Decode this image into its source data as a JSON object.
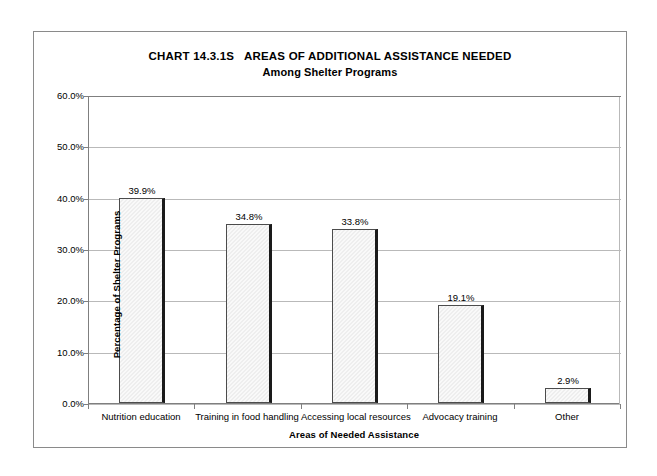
{
  "chart_data": {
    "type": "bar",
    "title": "CHART 14.3.1S   AREAS OF ADDITIONAL ASSISTANCE NEEDED",
    "subtitle": "Among Shelter Programs",
    "xlabel": "Areas of Needed Assistance",
    "ylabel": "Percentage of Shelter Programs",
    "categories": [
      "Nutrition education",
      "Training in food handling",
      "Accessing local resources",
      "Advocacy training",
      "Other"
    ],
    "values": [
      39.9,
      34.8,
      33.8,
      19.1,
      2.9
    ],
    "value_labels": [
      "39.9%",
      "34.8%",
      "33.8%",
      "19.1%",
      "2.9%"
    ],
    "ylim": [
      0,
      60
    ],
    "ytick_values": [
      0,
      10,
      20,
      30,
      40,
      50,
      60
    ],
    "ytick_labels": [
      "0.0%",
      "10.0%",
      "20.0%",
      "30.0%",
      "40.0%",
      "50.0%",
      "60.0%"
    ],
    "grid": true,
    "legend": false,
    "legend_position": "none",
    "bar_fill_color": "#eeeeee",
    "bar_border_color": "#4c4c4c",
    "gridline_color": "#b9b9b9",
    "axis_color": "#7f7f7f",
    "frame_color": "#8a8a8a",
    "background_color": "#ffffff",
    "text_color": "#000000"
  }
}
